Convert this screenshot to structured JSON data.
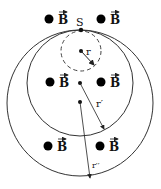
{
  "diagram": {
    "point_label": "S",
    "field_label": "B",
    "radius_labels": {
      "inner": "r",
      "middle": "r′",
      "outer": "r′′"
    },
    "circles": [
      {
        "name": "inner-dashed",
        "cx": 81,
        "cy": 51,
        "r": 20,
        "style": "dashed"
      },
      {
        "name": "middle",
        "cx": 80,
        "cy": 83,
        "r": 53,
        "style": "solid"
      },
      {
        "name": "outer",
        "cx": 80,
        "cy": 103,
        "r": 73,
        "style": "solid"
      }
    ],
    "field_markers": [
      {
        "x": 47,
        "y": 19
      },
      {
        "x": 100,
        "y": 19
      },
      {
        "x": 49,
        "y": 82
      },
      {
        "x": 100,
        "y": 82
      },
      {
        "x": 47,
        "y": 147
      },
      {
        "x": 100,
        "y": 147
      }
    ],
    "colors": {
      "ink": "#111111",
      "background": "#ffffff"
    }
  }
}
